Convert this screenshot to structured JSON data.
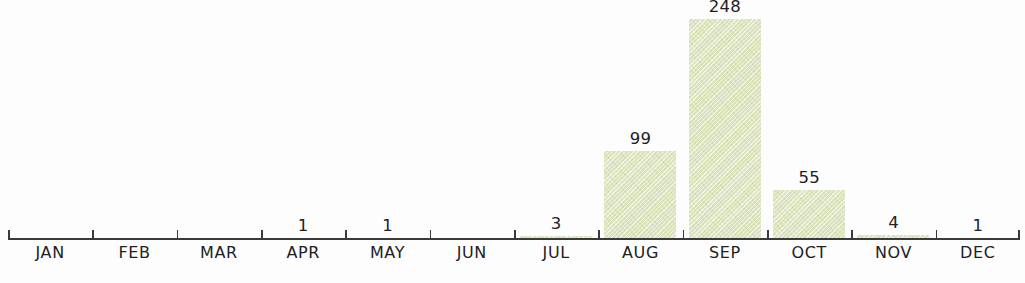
{
  "chart_data": {
    "type": "bar",
    "title": "",
    "subtitle": "",
    "xlabel": "",
    "ylabel": "",
    "categories": [
      "JAN",
      "FEB",
      "MAR",
      "APR",
      "MAY",
      "JUN",
      "JUL",
      "AUG",
      "SEP",
      "OCT",
      "NOV",
      "DEC"
    ],
    "values": [
      0,
      0,
      0,
      1,
      1,
      0,
      3,
      99,
      248,
      55,
      4,
      1
    ],
    "value_labels": [
      "",
      "",
      "",
      "1",
      "1",
      "",
      "3",
      "99",
      "248",
      "55",
      "4",
      "1"
    ],
    "ylim": [
      0,
      248
    ],
    "grid": false,
    "legend": null,
    "axis": {
      "baseline_visible": true,
      "tick_count": 13,
      "tick_direction": "up",
      "y_axis_visible": false
    },
    "colors": {
      "bar_fill": "#dde5bf",
      "axis": "#3a3a38",
      "text": "#22211f",
      "background": "#fdfdfd"
    }
  },
  "caption": {
    "clipped_text": ""
  }
}
